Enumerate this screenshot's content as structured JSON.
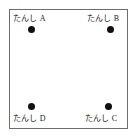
{
  "diagram": {
    "frame": {
      "shape": "square",
      "border_color": "#6d6d6d",
      "fill_color": "#ffffff"
    },
    "dot_color": "#101010",
    "terminals": [
      {
        "id": "A",
        "label": "たんし A",
        "position": "top-left",
        "label_placement": "above-dot"
      },
      {
        "id": "B",
        "label": "たんし B",
        "position": "top-right",
        "label_placement": "above-dot"
      },
      {
        "id": "C",
        "label": "たんし C",
        "position": "bottom-right",
        "label_placement": "below-dot"
      },
      {
        "id": "D",
        "label": "たんし D",
        "position": "bottom-left",
        "label_placement": "below-dot"
      }
    ]
  }
}
